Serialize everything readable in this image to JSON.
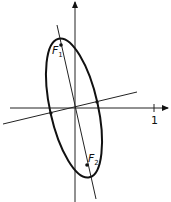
{
  "diagram": {
    "type": "rotated-ellipse-with-foci",
    "axes": {
      "x_tick_label": "1"
    },
    "foci": [
      {
        "name": "F",
        "subscript": "1"
      },
      {
        "name": "F",
        "subscript": "2"
      }
    ],
    "colors": {
      "stroke": "#111111",
      "background": "#ffffff"
    }
  }
}
